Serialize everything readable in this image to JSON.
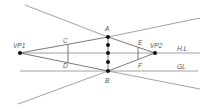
{
  "diagram": {
    "type": "two-point-perspective",
    "labels": {
      "vp1": "VP1",
      "vp2": "VP2",
      "a": "A",
      "b": "B",
      "c": "C",
      "d": "D",
      "e": "E",
      "f": "F",
      "horizon_line": "H.L",
      "ground_line": "GL"
    },
    "colors": {
      "line": "#8a8a8a",
      "point": "#111111",
      "label": "#555555"
    }
  }
}
